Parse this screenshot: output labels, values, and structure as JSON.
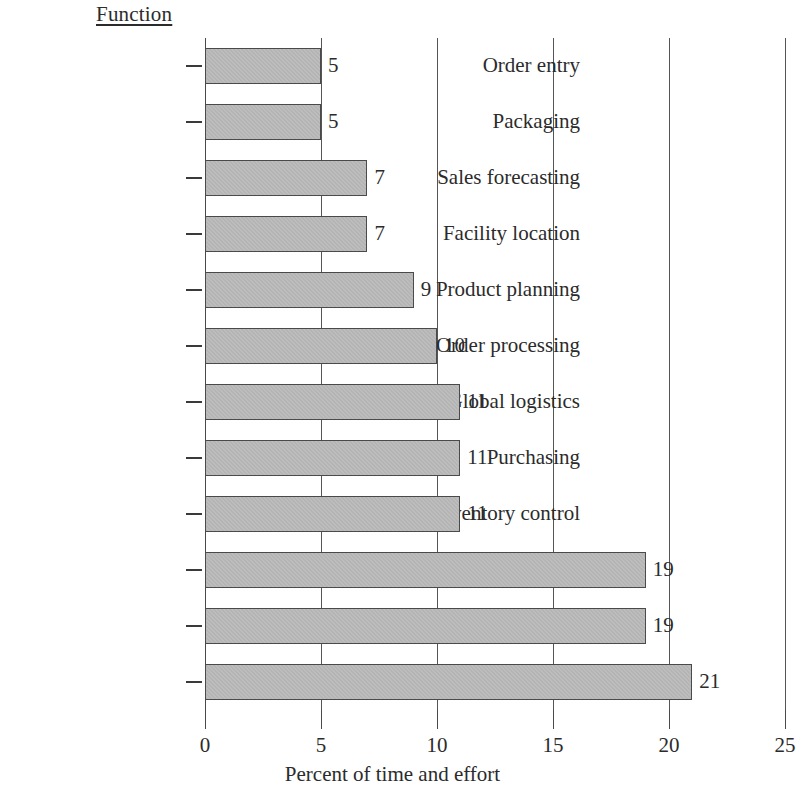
{
  "header": {
    "category_axis_title": "Function"
  },
  "chart_data": {
    "type": "bar",
    "orientation": "horizontal",
    "title": "",
    "subtitle": "",
    "xlabel": "Percent of time and effort",
    "ylabel": "Function",
    "xlim": [
      0,
      25
    ],
    "xticks": [
      0,
      5,
      10,
      15,
      20,
      25
    ],
    "xtick_labels": [
      "0",
      "5",
      "10",
      "15",
      "20",
      "25"
    ],
    "grid": "vertical",
    "legend": "none",
    "bar_fill_color": "#b4b4b4",
    "bar_edge_color": "#4a4a4a",
    "gridline_color": "#555555",
    "text_color": "#2b2b2b",
    "background_color": "#ffffff",
    "categories": [
      "Order entry",
      "Packaging",
      "Sales forecasting",
      "Facility location",
      "Product planning",
      "Order processing",
      "Global logistics",
      "Purchasing",
      "Inventory control",
      "Warehousing",
      "Traffic management",
      "General management"
    ],
    "values": [
      5,
      5,
      7,
      7,
      9,
      10,
      11,
      11,
      11,
      19,
      19,
      21
    ],
    "data_labels": [
      "5",
      "5",
      "7",
      "7",
      "9",
      "10",
      "11",
      "11",
      "11",
      "19",
      "19",
      "21"
    ],
    "bars": [
      {
        "category": "Order entry",
        "value": 5,
        "label": "5"
      },
      {
        "category": "Packaging",
        "value": 5,
        "label": "5"
      },
      {
        "category": "Sales forecasting",
        "value": 7,
        "label": "7"
      },
      {
        "category": "Facility location",
        "value": 7,
        "label": "7"
      },
      {
        "category": "Product planning",
        "value": 9,
        "label": "9"
      },
      {
        "category": "Order processing",
        "value": 10,
        "label": "10"
      },
      {
        "category": "Global logistics",
        "value": 11,
        "label": "11"
      },
      {
        "category": "Purchasing",
        "value": 11,
        "label": "11"
      },
      {
        "category": "Inventory control",
        "value": 11,
        "label": "11"
      },
      {
        "category": "Warehousing",
        "value": 19,
        "label": "19"
      },
      {
        "category": "Traffic management",
        "value": 19,
        "label": "19"
      },
      {
        "category": "General management",
        "value": 21,
        "label": "21"
      }
    ]
  }
}
